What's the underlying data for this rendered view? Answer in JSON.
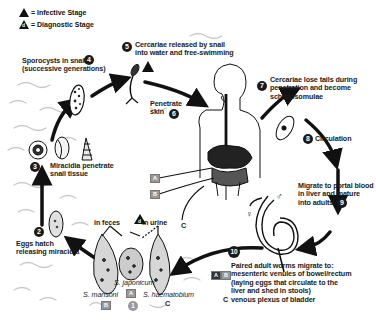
{
  "legend": {
    "infective": {
      "symbol": "triangle",
      "label": "= Infective Stage"
    },
    "diagnostic": {
      "symbol": "triangle-d",
      "label": "= Diagnostic Stage",
      "letter": "d"
    }
  },
  "steps": [
    {
      "n": "1",
      "label": ""
    },
    {
      "n": "2",
      "line1": "Eggs hatch",
      "line2": "releasing miracidia"
    },
    {
      "n": "3",
      "line1": "Miracidia penetrate",
      "line2": "snail tissue"
    },
    {
      "n": "4",
      "line1": "Sporocysts in snail",
      "line2": "(successive generations)"
    },
    {
      "n": "5",
      "line1": "Cercariae released by snail",
      "line2": "into water and free-swimming"
    },
    {
      "n": "6",
      "line1": "Penetrate",
      "line2": "skin"
    },
    {
      "n": "7",
      "line1": "Cercariae lose tails during",
      "line2": "penetration and become",
      "line3": "schistosomulae"
    },
    {
      "n": "8",
      "line1": "Circulation"
    },
    {
      "n": "9",
      "line1": "Migrate to portal blood",
      "line2": "in liver and mature",
      "line3": "into adults"
    },
    {
      "n": "10",
      "line1": "Paired adult worms migrate to:",
      "line2": "mesenteric venules of bowel/rectum",
      "line3": "(laying eggs that circulate to the",
      "line4": "liver and shed in stools)",
      "line5": "venous plexus of bladder"
    }
  ],
  "eggs": {
    "in_feces": "in feces",
    "in_urine": "in urine",
    "species": [
      {
        "name": "S. mansoni",
        "tag": "B"
      },
      {
        "name": "S. japonicum",
        "tag": "A"
      },
      {
        "name": "S. haematobium",
        "tag": "C"
      }
    ]
  },
  "body_labels": {
    "a": "A",
    "b": "B",
    "c": "C"
  },
  "worm_labels": {
    "male": "♂",
    "female": "♀"
  },
  "step10_tags": {
    "a": "A",
    "b": "B",
    "c": "C"
  },
  "colors": {
    "ink": "#111111",
    "tag_gray": "#9a9a9a",
    "water": "#c8c8c8"
  }
}
